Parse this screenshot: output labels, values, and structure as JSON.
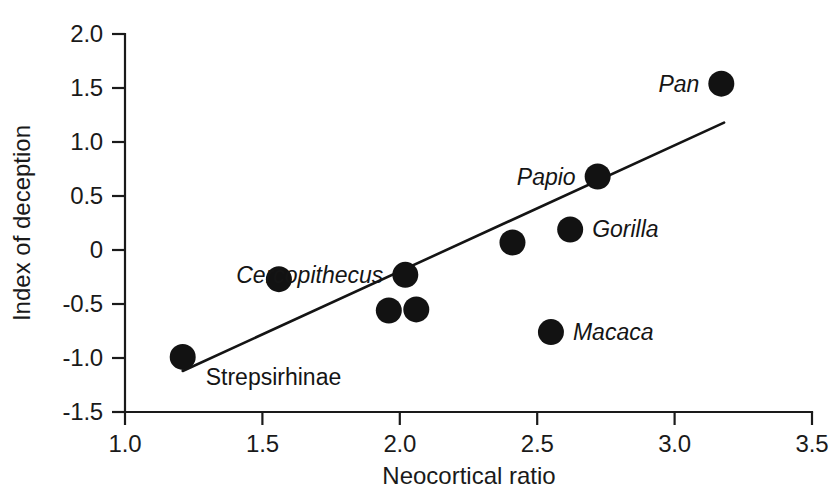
{
  "chart_data": {
    "type": "scatter",
    "title": "",
    "xlabel": "Neocortical ratio",
    "ylabel": "Index of deception",
    "xlim": [
      1.0,
      3.5
    ],
    "ylim": [
      -1.5,
      2.0
    ],
    "grid": false,
    "legend": "none",
    "xticks": [
      "1.0",
      "1.5",
      "2.0",
      "2.5",
      "3.0",
      "3.5"
    ],
    "xtick_values": [
      1.0,
      1.5,
      2.0,
      2.5,
      3.0,
      3.5
    ],
    "yticks": [
      "2.0",
      "1.5",
      "1.0",
      "0.5",
      "0",
      "-0.5",
      "-1.0",
      "-1.5"
    ],
    "ytick_values": [
      2.0,
      1.5,
      1.0,
      0.5,
      0.0,
      -0.5,
      -1.0,
      -1.5
    ],
    "points": [
      {
        "label": "Strepsirhinae",
        "x": 1.21,
        "y": -0.99,
        "italic": false,
        "label_pos": "below-right"
      },
      {
        "label": "",
        "x": 1.56,
        "y": -0.27,
        "italic": true,
        "label_pos": "none"
      },
      {
        "label": "",
        "x": 1.96,
        "y": -0.56,
        "italic": true,
        "label_pos": "none"
      },
      {
        "label": "",
        "x": 2.06,
        "y": -0.55,
        "italic": true,
        "label_pos": "none"
      },
      {
        "label": "Cercopithecus",
        "x": 2.02,
        "y": -0.23,
        "italic": true,
        "label_pos": "left"
      },
      {
        "label": "",
        "x": 2.41,
        "y": 0.07,
        "italic": true,
        "label_pos": "none"
      },
      {
        "label": "Gorilla",
        "x": 2.62,
        "y": 0.19,
        "italic": true,
        "label_pos": "right"
      },
      {
        "label": "Macaca",
        "x": 2.55,
        "y": -0.76,
        "italic": true,
        "label_pos": "right"
      },
      {
        "label": "Papio",
        "x": 2.72,
        "y": 0.68,
        "italic": true,
        "label_pos": "left"
      },
      {
        "label": "Pan",
        "x": 3.17,
        "y": 1.54,
        "italic": true,
        "label_pos": "left"
      }
    ],
    "trendline": {
      "name": "regression-line",
      "x_start": 1.21,
      "y_start": -1.12,
      "x_end": 3.18,
      "y_end": 1.18
    }
  },
  "colors": {
    "axis": "#1a1a1a",
    "point": "#121212",
    "line": "#141414",
    "background": "#ffffff"
  }
}
